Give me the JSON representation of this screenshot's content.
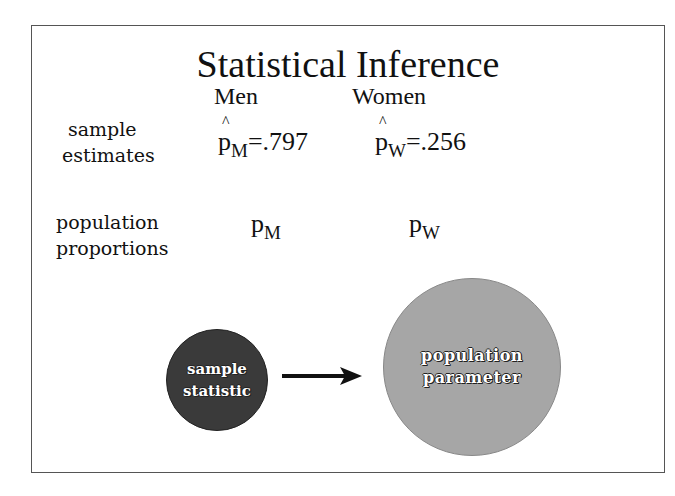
{
  "slide": {
    "title": "Statistical Inference",
    "columns": [
      "Men",
      "Women"
    ],
    "rows": [
      {
        "label_line1": "sample",
        "label_line2": "estimates",
        "men": {
          "symbol": "p",
          "hat": "^",
          "subscript": "M",
          "value": "=.797"
        },
        "women": {
          "symbol": "p",
          "hat": "^",
          "subscript": "W",
          "value": "=.256"
        }
      },
      {
        "label_line1": "population",
        "label_line2": "proportions",
        "men": {
          "symbol": "p",
          "subscript": "M"
        },
        "women": {
          "symbol": "p",
          "subscript": "W"
        }
      }
    ],
    "diagram": {
      "source": {
        "line1": "sample",
        "line2": "statistic",
        "color": "#3a3a3a"
      },
      "target": {
        "line1": "population",
        "line2": "parameter",
        "color": "#a6a6a6"
      },
      "arrow_color": "#111111"
    }
  }
}
